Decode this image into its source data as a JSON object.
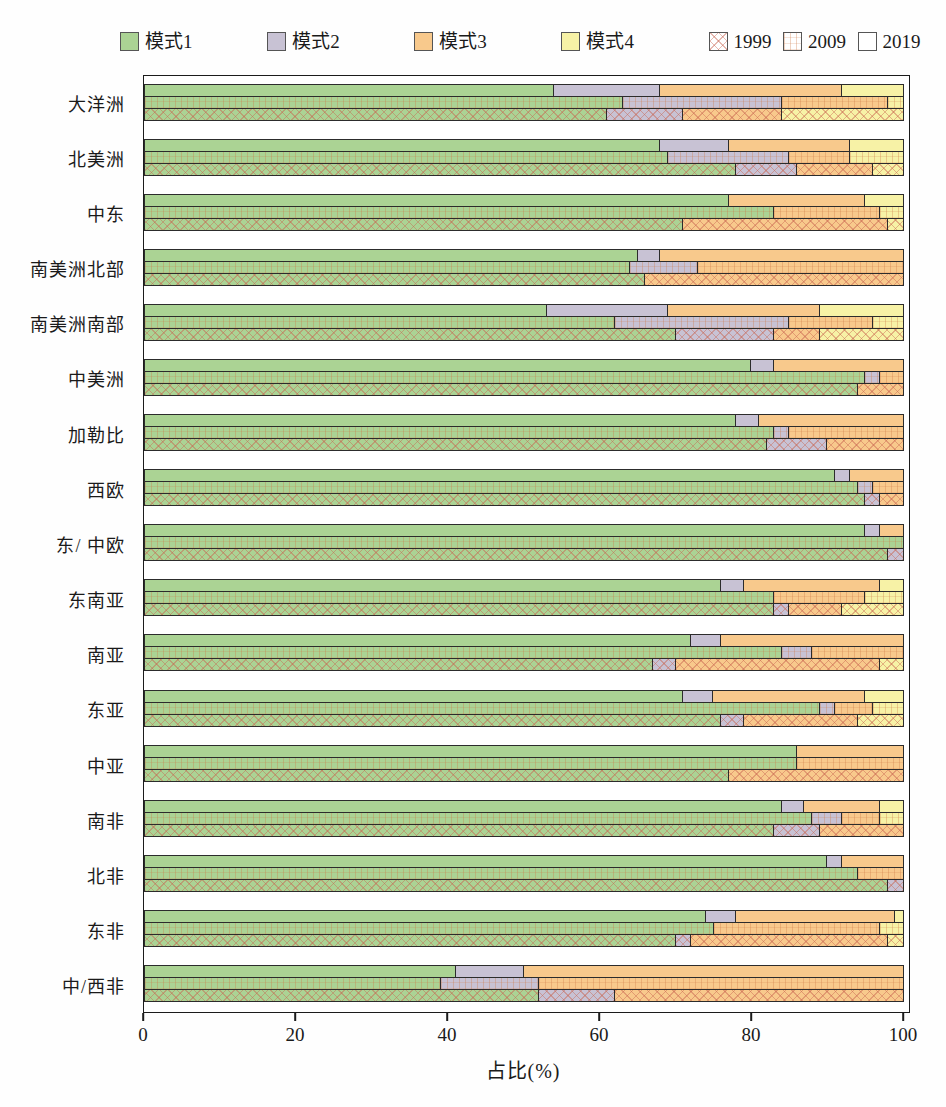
{
  "legend": {
    "modes": [
      {
        "label": "模式1",
        "color": "#abd394"
      },
      {
        "label": "模式2",
        "color": "#c8c2d4"
      },
      {
        "label": "模式3",
        "color": "#f8c98c"
      },
      {
        "label": "模式4",
        "color": "#f7f2a6"
      }
    ],
    "years": [
      {
        "label": "1999",
        "pattern": "diagonal-crosshatch"
      },
      {
        "label": "2009",
        "pattern": "grid"
      },
      {
        "label": "2019",
        "pattern": "plain"
      }
    ]
  },
  "chart_data": {
    "type": "bar",
    "orientation": "horizontal",
    "stacked": true,
    "title": "",
    "xlabel": "占比(%)",
    "ylabel": "",
    "xlim": [
      0,
      100
    ],
    "xticks": [
      0,
      20,
      40,
      60,
      80,
      100
    ],
    "grid": false,
    "legend_position": "top",
    "series_labels": [
      "模式1",
      "模式2",
      "模式3",
      "模式4"
    ],
    "bar_order_top_to_bottom": [
      "2019",
      "2009",
      "1999"
    ],
    "regions": [
      {
        "name": "大洋洲",
        "bars": {
          "2019": [
            54,
            14,
            24,
            8
          ],
          "2009": [
            63,
            21,
            14,
            2
          ],
          "1999": [
            61,
            10,
            13,
            16
          ]
        }
      },
      {
        "name": "北美洲",
        "bars": {
          "2019": [
            68,
            9,
            16,
            7
          ],
          "2009": [
            69,
            16,
            8,
            7
          ],
          "1999": [
            78,
            8,
            10,
            4
          ]
        }
      },
      {
        "name": "中东",
        "bars": {
          "2019": [
            77,
            0,
            18,
            5
          ],
          "2009": [
            83,
            0,
            14,
            3
          ],
          "1999": [
            71,
            0,
            27,
            2
          ]
        }
      },
      {
        "name": "南美洲北部",
        "bars": {
          "2019": [
            65,
            3,
            32,
            0
          ],
          "2009": [
            64,
            9,
            27,
            0
          ],
          "1999": [
            66,
            0,
            34,
            0
          ]
        }
      },
      {
        "name": "南美洲南部",
        "bars": {
          "2019": [
            53,
            16,
            20,
            11
          ],
          "2009": [
            62,
            23,
            11,
            4
          ],
          "1999": [
            70,
            13,
            6,
            11
          ]
        }
      },
      {
        "name": "中美洲",
        "bars": {
          "2019": [
            80,
            3,
            17,
            0
          ],
          "2009": [
            95,
            2,
            3,
            0
          ],
          "1999": [
            94,
            0,
            6,
            0
          ]
        }
      },
      {
        "name": "加勒比",
        "bars": {
          "2019": [
            78,
            3,
            19,
            0
          ],
          "2009": [
            83,
            2,
            15,
            0
          ],
          "1999": [
            82,
            8,
            10,
            0
          ]
        }
      },
      {
        "name": "西欧",
        "bars": {
          "2019": [
            91,
            2,
            7,
            0
          ],
          "2009": [
            94,
            2,
            4,
            0
          ],
          "1999": [
            95,
            2,
            3,
            0
          ]
        }
      },
      {
        "name": "东/ 中欧",
        "bars": {
          "2019": [
            95,
            2,
            3,
            0
          ],
          "2009": [
            100,
            0,
            0,
            0
          ],
          "1999": [
            98,
            2,
            0,
            0
          ]
        }
      },
      {
        "name": "东南亚",
        "bars": {
          "2019": [
            76,
            3,
            18,
            3
          ],
          "2009": [
            83,
            0,
            12,
            5
          ],
          "1999": [
            83,
            2,
            7,
            8
          ]
        }
      },
      {
        "name": "南亚",
        "bars": {
          "2019": [
            72,
            4,
            24,
            0
          ],
          "2009": [
            84,
            4,
            12,
            0
          ],
          "1999": [
            67,
            3,
            27,
            3
          ]
        }
      },
      {
        "name": "东亚",
        "bars": {
          "2019": [
            71,
            4,
            20,
            5
          ],
          "2009": [
            89,
            2,
            5,
            4
          ],
          "1999": [
            76,
            3,
            15,
            6
          ]
        }
      },
      {
        "name": "中亚",
        "bars": {
          "2019": [
            86,
            0,
            14,
            0
          ],
          "2009": [
            86,
            0,
            14,
            0
          ],
          "1999": [
            77,
            0,
            23,
            0
          ]
        }
      },
      {
        "name": "南非",
        "bars": {
          "2019": [
            84,
            3,
            10,
            3
          ],
          "2009": [
            88,
            4,
            5,
            3
          ],
          "1999": [
            83,
            6,
            11,
            0
          ]
        }
      },
      {
        "name": "北非",
        "bars": {
          "2019": [
            90,
            2,
            8,
            0
          ],
          "2009": [
            94,
            0,
            6,
            0
          ],
          "1999": [
            98,
            2,
            0,
            0
          ]
        }
      },
      {
        "name": "东非",
        "bars": {
          "2019": [
            74,
            4,
            21,
            1
          ],
          "2009": [
            75,
            0,
            22,
            3
          ],
          "1999": [
            70,
            2,
            26,
            2
          ]
        }
      },
      {
        "name": "中/西非",
        "bars": {
          "2019": [
            41,
            9,
            50,
            0
          ],
          "2009": [
            39,
            13,
            48,
            0
          ],
          "1999": [
            52,
            10,
            38,
            0
          ]
        }
      }
    ]
  }
}
